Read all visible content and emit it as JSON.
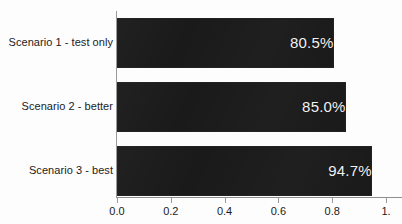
{
  "chart_data": {
    "type": "bar",
    "orientation": "horizontal",
    "title": "",
    "xlabel": "",
    "ylabel": "",
    "categories": [
      "Scenario 1 - test only",
      "Scenario 2 - better",
      "Scenario 3 - best"
    ],
    "values": [
      0.805,
      0.85,
      0.947
    ],
    "value_labels": [
      "80.5%",
      "85.0%",
      "94.7%"
    ],
    "xlim": [
      0.0,
      1.0
    ],
    "xticks": [
      0.0,
      0.2,
      0.4,
      0.6,
      0.8,
      1.0
    ],
    "xtick_labels": [
      "0.0",
      "0.2",
      "0.4",
      "0.6",
      "0.8",
      "1."
    ],
    "grid": false,
    "legend": null,
    "colors": {
      "bar_fill": "#1a1a1a",
      "value_text": "#f2f2f2",
      "category_text": "#1b1b1b",
      "axis_line": "#8f8f8f",
      "background": "#fdfdfd"
    }
  }
}
